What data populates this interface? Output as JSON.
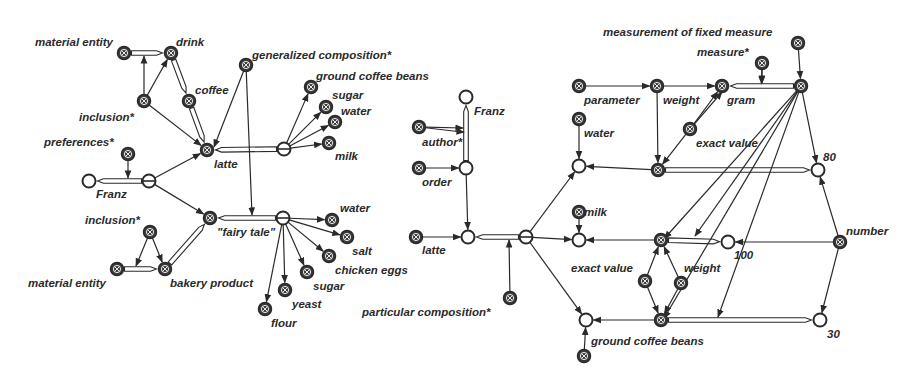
{
  "diagram": {
    "title": "",
    "colors": {
      "ink": "#2a2a2a",
      "background": "#ffffff",
      "node_fill": "#3a3a3a"
    },
    "nodes": [
      {
        "id": "me1",
        "x": 124,
        "y": 53,
        "type": "x",
        "label": "material entity",
        "lx": 35,
        "ly": 46
      },
      {
        "id": "drink",
        "x": 171,
        "y": 53,
        "type": "x",
        "label": "drink",
        "lx": 176,
        "ly": 46
      },
      {
        "id": "incl1",
        "x": 144,
        "y": 101,
        "type": "x",
        "label": "inclusion*",
        "lx": 79,
        "ly": 121
      },
      {
        "id": "coffee",
        "x": 189,
        "y": 101,
        "type": "x",
        "label": "coffee",
        "lx": 195,
        "ly": 94
      },
      {
        "id": "gencomp",
        "x": 246,
        "y": 65,
        "type": "x",
        "label": "generalized composition*",
        "lx": 252,
        "ly": 59
      },
      {
        "id": "gcb1",
        "x": 311,
        "y": 87,
        "type": "x",
        "label": "ground coffee beans",
        "lx": 316,
        "ly": 80
      },
      {
        "id": "sugar1",
        "x": 326,
        "y": 107,
        "type": "x",
        "label": "sugar",
        "lx": 332,
        "ly": 99
      },
      {
        "id": "water1",
        "x": 335,
        "y": 122,
        "type": "x",
        "label": "water",
        "lx": 341,
        "ly": 115
      },
      {
        "id": "milk1",
        "x": 329,
        "y": 143,
        "type": "x",
        "label": "milk",
        "lx": 335,
        "ly": 160
      },
      {
        "id": "latte1",
        "x": 207,
        "y": 150,
        "type": "x",
        "label": "latte",
        "lx": 214,
        "ly": 168
      },
      {
        "id": "comp1",
        "x": 284,
        "y": 149,
        "type": "o2",
        "label": "",
        "lx": 0,
        "ly": 0
      },
      {
        "id": "pref",
        "x": 128,
        "y": 154,
        "type": "x",
        "label": "preferences*",
        "lx": 44,
        "ly": 146
      },
      {
        "id": "franz1",
        "x": 89,
        "y": 181,
        "type": "o",
        "label": "Franz",
        "lx": 96,
        "ly": 198
      },
      {
        "id": "pj1",
        "x": 149,
        "y": 181,
        "type": "o2",
        "label": "",
        "lx": 0,
        "ly": 0
      },
      {
        "id": "incl2",
        "x": 150,
        "y": 232,
        "type": "x",
        "label": "inclusion*",
        "lx": 85,
        "ly": 224
      },
      {
        "id": "fairy",
        "x": 210,
        "y": 218,
        "type": "x",
        "label": "\"fairy tale\"",
        "lx": 217,
        "ly": 236
      },
      {
        "id": "comp2",
        "x": 283,
        "y": 218,
        "type": "o2",
        "label": "",
        "lx": 0,
        "ly": 0
      },
      {
        "id": "water2",
        "x": 332,
        "y": 220,
        "type": "x",
        "label": "water",
        "lx": 340,
        "ly": 212
      },
      {
        "id": "salt",
        "x": 347,
        "y": 237,
        "type": "x",
        "label": "salt",
        "lx": 352,
        "ly": 255
      },
      {
        "id": "eggs",
        "x": 329,
        "y": 256,
        "type": "x",
        "label": "chicken eggs",
        "lx": 335,
        "ly": 274
      },
      {
        "id": "sugar2",
        "x": 307,
        "y": 272,
        "type": "x",
        "label": "sugar",
        "lx": 313,
        "ly": 290
      },
      {
        "id": "yeast",
        "x": 285,
        "y": 290,
        "type": "x",
        "label": "yeast",
        "lx": 292,
        "ly": 308
      },
      {
        "id": "flour",
        "x": 265,
        "y": 309,
        "type": "x",
        "label": "flour",
        "lx": 271,
        "ly": 327
      },
      {
        "id": "me2",
        "x": 117,
        "y": 269,
        "type": "x",
        "label": "material entity",
        "lx": 28,
        "ly": 287
      },
      {
        "id": "bakery",
        "x": 165,
        "y": 269,
        "type": "x",
        "label": "bakery product",
        "lx": 170,
        "ly": 287
      },
      {
        "id": "franz2",
        "x": 466,
        "y": 97,
        "type": "o",
        "label": "Franz",
        "lx": 474,
        "ly": 115
      },
      {
        "id": "author",
        "x": 419,
        "y": 127,
        "type": "x",
        "label": "author*",
        "lx": 422,
        "ly": 146
      },
      {
        "id": "order",
        "x": 419,
        "y": 168,
        "type": "x",
        "label": "order",
        "lx": 422,
        "ly": 186
      },
      {
        "id": "pj2",
        "x": 466,
        "y": 168,
        "type": "o",
        "label": "",
        "lx": 0,
        "ly": 0
      },
      {
        "id": "latte2",
        "x": 416,
        "y": 237,
        "type": "x",
        "label": "latte",
        "lx": 422,
        "ly": 254
      },
      {
        "id": "set2",
        "x": 468,
        "y": 237,
        "type": "o",
        "label": "",
        "lx": 0,
        "ly": 0
      },
      {
        "id": "comp3",
        "x": 526,
        "y": 237,
        "type": "o2",
        "label": "",
        "lx": 0,
        "ly": 0
      },
      {
        "id": "partcomp",
        "x": 510,
        "y": 298,
        "type": "x",
        "label": "particular composition*",
        "lx": 362,
        "ly": 316
      },
      {
        "id": "param",
        "x": 579,
        "y": 86,
        "type": "x",
        "label": "parameter",
        "lx": 584,
        "ly": 104
      },
      {
        "id": "weight1",
        "x": 657,
        "y": 86,
        "type": "x",
        "label": "weight",
        "lx": 663,
        "ly": 104
      },
      {
        "id": "gram",
        "x": 722,
        "y": 86,
        "type": "x",
        "label": "gram",
        "lx": 727,
        "ly": 104
      },
      {
        "id": "measure",
        "x": 762,
        "y": 63,
        "type": "x",
        "label": "measure*",
        "lx": 697,
        "ly": 56
      },
      {
        "id": "mfm_top",
        "x": 798,
        "y": 43,
        "type": "x",
        "label": "measurement of fixed measure",
        "lx": 603,
        "ly": 36
      },
      {
        "id": "mfm",
        "x": 801,
        "y": 86,
        "type": "x",
        "label": "",
        "lx": 0,
        "ly": 0
      },
      {
        "id": "water3",
        "x": 579,
        "y": 119,
        "type": "x",
        "label": "water",
        "lx": 584,
        "ly": 137
      },
      {
        "id": "ev1",
        "x": 690,
        "y": 129,
        "type": "x",
        "label": "exact value",
        "lx": 696,
        "ly": 147
      },
      {
        "id": "setw",
        "x": 579,
        "y": 166,
        "type": "o",
        "label": "",
        "lx": 0,
        "ly": 0
      },
      {
        "id": "qw",
        "x": 658,
        "y": 170,
        "type": "x",
        "label": "",
        "lx": 0,
        "ly": 0
      },
      {
        "id": "n80",
        "x": 818,
        "y": 170,
        "type": "o",
        "label": "80",
        "lx": 823,
        "ly": 161
      },
      {
        "id": "milk2",
        "x": 579,
        "y": 212,
        "type": "x",
        "label": "milk",
        "lx": 584,
        "ly": 216
      },
      {
        "id": "setm",
        "x": 579,
        "y": 240,
        "type": "o",
        "label": "",
        "lx": 0,
        "ly": 0
      },
      {
        "id": "qm",
        "x": 661,
        "y": 240,
        "type": "x",
        "label": "",
        "lx": 0,
        "ly": 0
      },
      {
        "id": "n100",
        "x": 728,
        "y": 242,
        "type": "o",
        "label": "100",
        "lx": 734,
        "ly": 259
      },
      {
        "id": "number",
        "x": 840,
        "y": 242,
        "type": "x",
        "label": "number",
        "lx": 846,
        "ly": 235
      },
      {
        "id": "ev2",
        "x": 645,
        "y": 281,
        "type": "x",
        "label": "exact value",
        "lx": 571,
        "ly": 272
      },
      {
        "id": "weight2",
        "x": 681,
        "y": 283,
        "type": "x",
        "label": "weight",
        "lx": 684,
        "ly": 272
      },
      {
        "id": "setg",
        "x": 586,
        "y": 320,
        "type": "o",
        "label": "",
        "lx": 0,
        "ly": 0
      },
      {
        "id": "qg",
        "x": 661,
        "y": 320,
        "type": "x",
        "label": "",
        "lx": 0,
        "ly": 0
      },
      {
        "id": "n30",
        "x": 820,
        "y": 320,
        "type": "o",
        "label": "30",
        "lx": 827,
        "ly": 338
      },
      {
        "id": "gcb2",
        "x": 584,
        "y": 356,
        "type": "x",
        "label": "ground coffee beans",
        "lx": 591,
        "ly": 345
      }
    ],
    "double_arcs": [
      [
        "me1",
        "drink"
      ],
      [
        "drink",
        "coffee"
      ],
      [
        "coffee",
        "latte1"
      ],
      [
        "comp1",
        "latte1"
      ],
      [
        "pj1",
        "franz1"
      ],
      [
        "comp2",
        "fairy"
      ],
      [
        "me2",
        "bakery"
      ],
      [
        "bakery",
        "fairy"
      ],
      [
        "pj2",
        "franz2"
      ],
      [
        "comp3",
        "set2"
      ],
      [
        "mfm",
        "gram"
      ],
      [
        "qw",
        "n80"
      ],
      [
        "qm",
        "n100"
      ],
      [
        "qg",
        "n30"
      ]
    ],
    "arcs": [
      [
        "incl1",
        "drink"
      ],
      [
        "incl1",
        "latte1"
      ],
      [
        "comp1",
        "gcb1"
      ],
      [
        "comp1",
        "sugar1"
      ],
      [
        "comp1",
        "water1"
      ],
      [
        "comp1",
        "milk1"
      ],
      [
        "pj1",
        "latte1"
      ],
      [
        "pj1",
        "fairy"
      ],
      [
        "incl2",
        "bakery"
      ],
      [
        "comp2",
        "water2"
      ],
      [
        "comp2",
        "salt"
      ],
      [
        "comp2",
        "eggs"
      ],
      [
        "comp2",
        "sugar2"
      ],
      [
        "comp2",
        "yeast"
      ],
      [
        "comp2",
        "flour"
      ],
      [
        "author",
        "franz2m"
      ],
      [
        "order",
        "pj2"
      ],
      [
        "pj2",
        "set2"
      ],
      [
        "latte2",
        "set2"
      ],
      [
        "comp3",
        "setw"
      ],
      [
        "comp3",
        "setm"
      ],
      [
        "comp3",
        "setg"
      ],
      [
        "param",
        "weight1"
      ],
      [
        "weight1",
        "gram"
      ],
      [
        "weight1",
        "qw"
      ],
      [
        "measure",
        "mfm_m"
      ],
      [
        "mfm_top",
        "mfm"
      ],
      [
        "water3",
        "setw"
      ],
      [
        "qw",
        "setw"
      ],
      [
        "ev1",
        "gram"
      ],
      [
        "ev1",
        "qw"
      ],
      [
        "mfm",
        "n80"
      ],
      [
        "milk2",
        "setm"
      ],
      [
        "qm",
        "setm"
      ],
      [
        "number",
        "n100"
      ],
      [
        "number",
        "n80"
      ],
      [
        "number",
        "n30"
      ],
      [
        "ev2",
        "qm"
      ],
      [
        "ev2",
        "qg"
      ],
      [
        "weight2",
        "qm"
      ],
      [
        "weight2",
        "qg"
      ],
      [
        "qg",
        "setg"
      ],
      [
        "gcb2",
        "setg"
      ],
      [
        "mfm",
        "qm_m"
      ],
      [
        "mfm",
        "qg_m"
      ]
    ],
    "arc_to_arc": [
      {
        "from": "incl1",
        "x2": 144,
        "y2": 56
      },
      {
        "from": "gencomp",
        "x2": 214,
        "y2": 147
      },
      {
        "from": "gencomp",
        "x2": 252,
        "y2": 215
      },
      {
        "from": "pref",
        "x2": 128,
        "y2": 178
      },
      {
        "from": "incl2",
        "x2": 136,
        "y2": 266
      },
      {
        "from": "author",
        "x2": 463,
        "y2": 128
      },
      {
        "from": "partcomp",
        "x2": 509,
        "y2": 240
      },
      {
        "from": "measure",
        "x2": 762,
        "y2": 83
      },
      {
        "from": "ev1",
        "x2": 722,
        "y2": 92
      },
      {
        "from": "mfm",
        "x2": 695,
        "y2": 236
      },
      {
        "from": "mfm",
        "x2": 718,
        "y2": 317
      }
    ]
  }
}
